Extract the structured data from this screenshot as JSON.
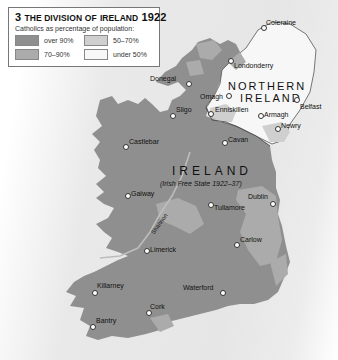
{
  "legend": {
    "number": "3",
    "title_prefix": "The division of",
    "title_place": "Ireland",
    "title_year": "1922",
    "subtitle": "Catholics as percentage of population:",
    "items": [
      {
        "label": "over 90%",
        "color": "#8f8f8f"
      },
      {
        "label": "50–70%",
        "color": "#cfcfcf"
      },
      {
        "label": "70–90%",
        "color": "#ababab"
      },
      {
        "label": "under 50%",
        "color": "#f7f7f7"
      }
    ]
  },
  "regions": {
    "northern_ireland": {
      "line1": "NORTHERN",
      "line2": "IRELAND"
    },
    "ireland": {
      "name": "IRELAND",
      "subtitle": "(Irish Free State 1922–37)"
    }
  },
  "river": "Shannon",
  "cities": [
    {
      "name": "Coleraine",
      "x": 263,
      "y": 27
    },
    {
      "name": "Londonderry",
      "x": 230,
      "y": 60
    },
    {
      "name": "Donegal",
      "x": 188,
      "y": 83
    },
    {
      "name": "Omagh",
      "x": 228,
      "y": 95
    },
    {
      "name": "Belfast",
      "x": 296,
      "y": 99
    },
    {
      "name": "Enniskillen",
      "x": 210,
      "y": 113
    },
    {
      "name": "Sligo",
      "x": 172,
      "y": 115
    },
    {
      "name": "Armagh",
      "x": 260,
      "y": 115
    },
    {
      "name": "Newry",
      "x": 277,
      "y": 128
    },
    {
      "name": "Castlebar",
      "x": 125,
      "y": 146
    },
    {
      "name": "Cavan",
      "x": 224,
      "y": 142
    },
    {
      "name": "Galway",
      "x": 127,
      "y": 195
    },
    {
      "name": "Dublin",
      "x": 272,
      "y": 203
    },
    {
      "name": "Tullamore",
      "x": 210,
      "y": 204
    },
    {
      "name": "Carlow",
      "x": 236,
      "y": 244
    },
    {
      "name": "Limerick",
      "x": 146,
      "y": 250
    },
    {
      "name": "Killarney",
      "x": 94,
      "y": 292
    },
    {
      "name": "Waterford",
      "x": 222,
      "y": 292
    },
    {
      "name": "Cork",
      "x": 148,
      "y": 312
    },
    {
      "name": "Bantry",
      "x": 92,
      "y": 326
    }
  ]
}
